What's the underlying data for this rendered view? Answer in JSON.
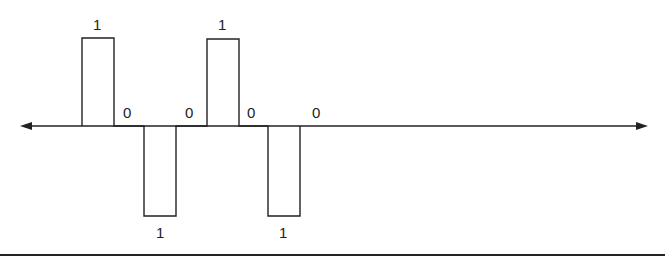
{
  "diagram": {
    "type": "bipolar-ami-waveform",
    "bits": [
      "1",
      "0",
      "1",
      "0",
      "1",
      "0",
      "1",
      "0"
    ],
    "labels": {
      "pulse_1": "1",
      "zero_1": "0",
      "pulse_2": "1",
      "zero_2": "0",
      "pulse_3": "1",
      "zero_3": "0",
      "pulse_4": "1",
      "zero_4": "0"
    },
    "colors": {
      "line": "#222222",
      "background": "#ffffff"
    }
  }
}
